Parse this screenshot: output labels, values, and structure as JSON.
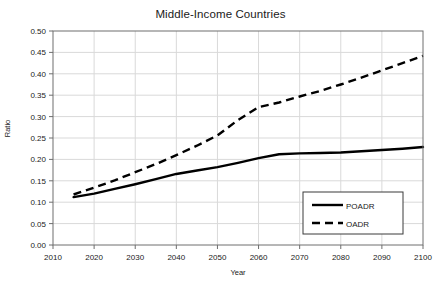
{
  "chart_data": {
    "type": "line",
    "title": "Middle-Income Countries",
    "xlabel": "Year",
    "ylabel": "Ratio",
    "xlim": [
      2010,
      2100
    ],
    "ylim": [
      0.0,
      0.5
    ],
    "grid": true,
    "legend_position": "bottom-right",
    "xticks": [
      "2010",
      "2020",
      "2030",
      "2040",
      "2050",
      "2060",
      "2070",
      "2080",
      "2090",
      "2100"
    ],
    "yticks": [
      "0.00",
      "0.05",
      "0.10",
      "0.15",
      "0.20",
      "0.25",
      "0.30",
      "0.35",
      "0.40",
      "0.45",
      "0.50"
    ],
    "x": [
      2015,
      2020,
      2025,
      2030,
      2035,
      2040,
      2045,
      2050,
      2055,
      2060,
      2065,
      2070,
      2075,
      2080,
      2085,
      2090,
      2095,
      2100
    ],
    "series": [
      {
        "name": "POADR",
        "style": "solid",
        "color": "#000000",
        "values": [
          0.112,
          0.12,
          0.131,
          0.142,
          0.154,
          0.166,
          0.174,
          0.182,
          0.192,
          0.203,
          0.212,
          0.214,
          0.215,
          0.216,
          0.219,
          0.222,
          0.225,
          0.229
        ]
      },
      {
        "name": "OADR",
        "style": "dashed",
        "color": "#000000",
        "values": [
          0.118,
          0.134,
          0.151,
          0.17,
          0.189,
          0.21,
          0.232,
          0.256,
          0.292,
          0.322,
          0.333,
          0.347,
          0.36,
          0.375,
          0.391,
          0.408,
          0.425,
          0.442
        ]
      }
    ]
  },
  "legend": {
    "items": [
      {
        "label": "POADR",
        "style": "solid"
      },
      {
        "label": "OADR",
        "style": "dashed"
      }
    ]
  }
}
